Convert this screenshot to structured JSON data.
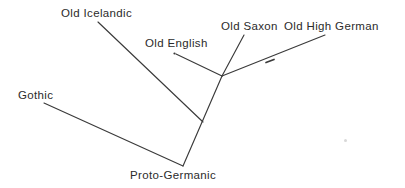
{
  "figure": {
    "type": "diagram",
    "background_color": "#ffffff",
    "line_color": "#3a3a3a",
    "text_color": "#2b2b2b"
  },
  "labels": {
    "old_icelandic": "Old Icelandic",
    "old_english": "Old English",
    "old_saxon": "Old Saxon",
    "old_high_german": "Old High German",
    "gothic": "Gothic",
    "proto_germanic": "Proto-Germanic"
  },
  "nodes": [
    {
      "id": "proto-germanic",
      "label": "Proto-Germanic",
      "x": 183,
      "y": 166,
      "role": "root"
    },
    {
      "id": "west-germanic",
      "label": "",
      "x": 222,
      "y": 76,
      "role": "internal"
    },
    {
      "id": "icelandic-join",
      "label": "",
      "x": 203,
      "y": 122,
      "role": "junction"
    },
    {
      "id": "old-icelandic",
      "label": "Old Icelandic",
      "x": 98,
      "y": 22,
      "role": "leaf"
    },
    {
      "id": "old-english",
      "label": "Old English",
      "x": 175,
      "y": 54,
      "role": "leaf"
    },
    {
      "id": "old-saxon",
      "label": "Old Saxon",
      "x": 244,
      "y": 35,
      "role": "leaf"
    },
    {
      "id": "old-high-german",
      "label": "Old High German",
      "x": 325,
      "y": 35,
      "role": "leaf"
    },
    {
      "id": "gothic",
      "label": "Gothic",
      "x": 44,
      "y": 103,
      "role": "leaf"
    }
  ],
  "edges": [
    {
      "from": "proto-germanic",
      "to": "west-germanic",
      "x1": 183,
      "y1": 166,
      "x2": 222,
      "y2": 76
    },
    {
      "from": "proto-germanic",
      "to": "gothic",
      "x1": 183,
      "y1": 166,
      "x2": 44,
      "y2": 103
    },
    {
      "from": "icelandic-join",
      "to": "old-icelandic",
      "x1": 203,
      "y1": 122,
      "x2": 98,
      "y2": 22
    },
    {
      "from": "west-germanic",
      "to": "old-english",
      "x1": 222,
      "y1": 76,
      "x2": 175,
      "y2": 54
    },
    {
      "from": "west-germanic",
      "to": "old-saxon",
      "x1": 222,
      "y1": 76,
      "x2": 244,
      "y2": 35
    },
    {
      "from": "west-germanic",
      "to": "old-high-german",
      "x1": 222,
      "y1": 76,
      "x2": 325,
      "y2": 35
    }
  ]
}
